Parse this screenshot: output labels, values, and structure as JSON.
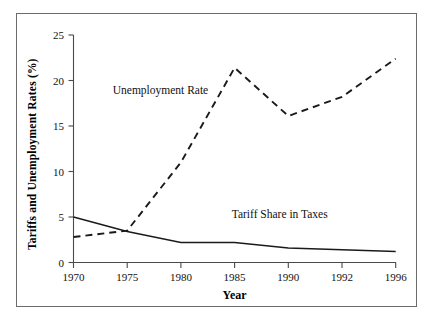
{
  "chart_data": {
    "type": "line",
    "title": "",
    "xlabel": "Year",
    "ylabel": "Tariffs and Unemployment Rates (%)",
    "categories": [
      "1970",
      "1975",
      "1980",
      "1985",
      "1990",
      "1992",
      "1996"
    ],
    "x_tick_labels": [
      "1970",
      "1975",
      "1980",
      "1985",
      "1990",
      "1992",
      "1996"
    ],
    "y_tick_labels": [
      "0",
      "5",
      "10",
      "15",
      "20",
      "25"
    ],
    "y_ticks": [
      0,
      5,
      10,
      15,
      20,
      25
    ],
    "ylim": [
      0,
      25
    ],
    "grid": false,
    "legend_position": "inline-annotations",
    "series": [
      {
        "name": "Unemployment Rate",
        "style": "dashed",
        "values": [
          2.8,
          3.5,
          11.0,
          21.4,
          16.1,
          18.2,
          22.4
        ]
      },
      {
        "name": "Tariff Share in Taxes",
        "style": "solid",
        "values": [
          5.0,
          3.4,
          2.2,
          2.2,
          1.6,
          1.4,
          1.2
        ]
      }
    ],
    "annotations": [
      {
        "text": "Unemployment Rate",
        "x_frac": 0.27,
        "y_value": 19.0
      },
      {
        "text": "Tariff Share in Taxes",
        "x_frac": 0.64,
        "y_value": 5.3
      }
    ]
  },
  "axis": {
    "x_title": "Year",
    "y_title": "Tariffs and Unemployment Rates (%)"
  }
}
